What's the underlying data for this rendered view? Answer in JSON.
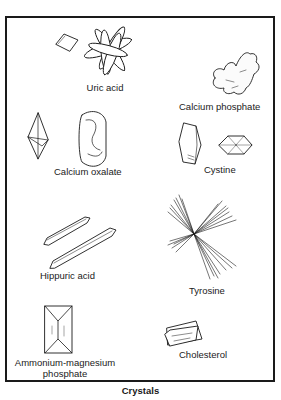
{
  "figure": {
    "caption": "Crystals",
    "crystals": [
      {
        "id": "uric-acid",
        "label": "Uric acid"
      },
      {
        "id": "calcium-phosphate",
        "label": "Calcium phosphate"
      },
      {
        "id": "calcium-oxalate",
        "label": "Calcium oxalate"
      },
      {
        "id": "cystine",
        "label": "Cystine"
      },
      {
        "id": "hippuric-acid",
        "label": "Hippuric acid"
      },
      {
        "id": "tyrosine",
        "label": "Tyrosine"
      },
      {
        "id": "ammonium-magnesium-phosphate",
        "label_line1": "Ammonium-magnesium",
        "label_line2": "phosphate"
      },
      {
        "id": "cholesterol",
        "label": "Cholesterol"
      }
    ]
  },
  "colors": {
    "ink": "#1a1a1a",
    "paper": "#ffffff"
  }
}
